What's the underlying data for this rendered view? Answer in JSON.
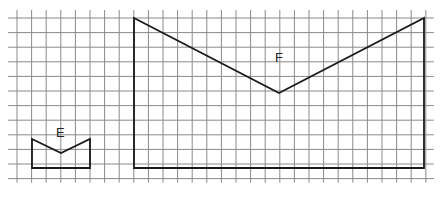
{
  "diagram": {
    "grid": {
      "x0": 17,
      "y0": 18,
      "step": 14.6,
      "cols": 29,
      "rows": 12,
      "color": "#8a8a8a"
    },
    "shapes": [
      {
        "label": "E",
        "points": [
          [
            32,
            139
          ],
          [
            61,
            153
          ],
          [
            90,
            139
          ],
          [
            90,
            168
          ],
          [
            32,
            168
          ]
        ],
        "label_pos": [
          61,
          133
        ]
      },
      {
        "label": "F",
        "points": [
          [
            134,
            18
          ],
          [
            279,
            93
          ],
          [
            424,
            18
          ],
          [
            424,
            168
          ],
          [
            134,
            168
          ]
        ],
        "label_pos": [
          280,
          58
        ]
      }
    ]
  }
}
